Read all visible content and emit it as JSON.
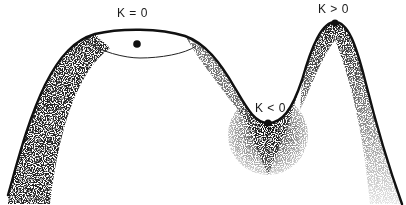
{
  "diagram": {
    "ink_color": "#111111",
    "background": "#ffffff",
    "points": [
      {
        "id": "plateau",
        "label": "K = 0",
        "x": 137,
        "y": 44,
        "label_x": 117,
        "label_y": 6
      },
      {
        "id": "saddle",
        "label": "K < 0",
        "x": 268,
        "y": 123,
        "label_x": 255,
        "label_y": 101
      },
      {
        "id": "peak",
        "label": "K > 0",
        "x": 335,
        "y": 22,
        "label_x": 318,
        "label_y": 2
      }
    ]
  }
}
